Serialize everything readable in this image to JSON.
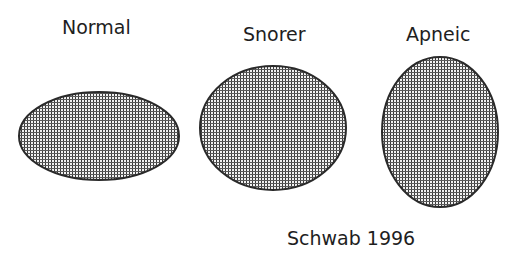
{
  "diagram": {
    "labels": {
      "normal": "Normal",
      "snorer": "Snorer",
      "apneic": "Apneic"
    },
    "caption": "Schwab 1996",
    "shapes": [
      {
        "name": "normal-airway",
        "type": "ellipse",
        "cx": 99,
        "cy": 136,
        "rx": 80,
        "ry": 44
      },
      {
        "name": "snorer-airway",
        "type": "ellipse",
        "cx": 273,
        "cy": 128,
        "rx": 73,
        "ry": 62
      },
      {
        "name": "apneic-airway",
        "type": "ellipse",
        "cx": 440,
        "cy": 132,
        "rx": 58,
        "ry": 75
      }
    ],
    "colors": {
      "background": "#ffffff",
      "outline": "#2a2a2a",
      "hatch": "#3a3a3a",
      "text": "#1e1e1e"
    }
  }
}
